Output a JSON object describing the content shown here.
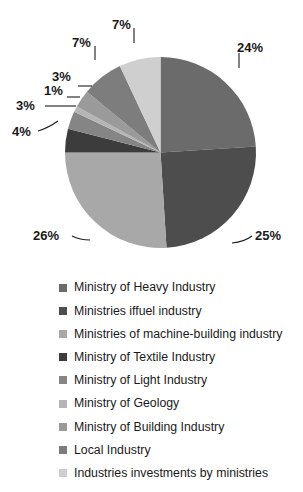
{
  "chart_data": {
    "type": "pie",
    "title": "",
    "subtitle": "",
    "xlabel": "",
    "ylabel": "",
    "grid": false,
    "legend_position": "bottom",
    "start_angle_deg": 0,
    "direction": "clockwise",
    "units": "percent",
    "total": 100,
    "categories": [
      "Ministry of Heavy Industry",
      "Ministries iffuel industry",
      "Ministries of machine-building industry",
      "Ministry of Textile Industry",
      "Ministry of Light Industry",
      "Ministry of Geology",
      "Ministry of Building Industry",
      "Local Industry",
      "Industries investments by ministries"
    ],
    "values": [
      24,
      25,
      26,
      4,
      3,
      1,
      3,
      7,
      7
    ],
    "data_labels": [
      "24%",
      "25%",
      "26%",
      "4%",
      "3%",
      "1%",
      "3%",
      "7%",
      "7%"
    ],
    "colors": [
      "#6b6b6b",
      "#4d4d4d",
      "#a8a8a8",
      "#3c3c3c",
      "#858585",
      "#b5b5b5",
      "#9a9a9a",
      "#7d7d7d",
      "#cfcfcf"
    ],
    "slices": [
      {
        "label": "Ministry of Heavy Industry",
        "value": 24,
        "data_label": "24%",
        "color": "#6b6b6b"
      },
      {
        "label": "Ministries iffuel industry",
        "value": 25,
        "data_label": "25%",
        "color": "#4d4d4d"
      },
      {
        "label": "Ministries of machine-building industry",
        "value": 26,
        "data_label": "26%",
        "color": "#a8a8a8"
      },
      {
        "label": "Ministry of Textile Industry",
        "value": 4,
        "data_label": "4%",
        "color": "#3c3c3c"
      },
      {
        "label": "Ministry of Light Industry",
        "value": 3,
        "data_label": "3%",
        "color": "#858585"
      },
      {
        "label": "Ministry of Geology",
        "value": 1,
        "data_label": "1%",
        "color": "#b5b5b5"
      },
      {
        "label": "Ministry of Building Industry",
        "value": 3,
        "data_label": "3%",
        "color": "#9a9a9a"
      },
      {
        "label": "Local Industry",
        "value": 7,
        "data_label": "7%",
        "color": "#7d7d7d"
      },
      {
        "label": "Industries investments by ministries",
        "value": 7,
        "data_label": "7%",
        "color": "#cfcfcf"
      }
    ]
  },
  "legend": {
    "items": [
      {
        "label": "Ministry of Heavy Industry",
        "color": "#6b6b6b"
      },
      {
        "label": "Ministries iffuel industry",
        "color": "#4d4d4d"
      },
      {
        "label": "Ministries of machine-building industry",
        "color": "#a8a8a8"
      },
      {
        "label": "Ministry of Textile Industry",
        "color": "#3c3c3c"
      },
      {
        "label": "Ministry of Light Industry",
        "color": "#858585"
      },
      {
        "label": "Ministry of Geology",
        "color": "#b5b5b5"
      },
      {
        "label": "Ministry of Building Industry",
        "color": "#9a9a9a"
      },
      {
        "label": "Local Industry",
        "color": "#7d7d7d"
      },
      {
        "label": "Industries investments by ministries",
        "color": "#cfcfcf"
      }
    ]
  }
}
